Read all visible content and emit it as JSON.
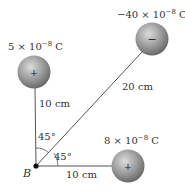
{
  "charges": [
    {
      "id": "q1",
      "label_base": "5 × 10",
      "label_exp": "−8",
      "label_unit": " C",
      "sign": "+",
      "cx": 34,
      "cy": 72
    },
    {
      "id": "q2",
      "label_base": "−40 × 10",
      "label_exp": "−8",
      "label_unit": " C",
      "sign": "−",
      "cx": 152,
      "cy": 39
    },
    {
      "id": "q3",
      "label_base": "8 × 10",
      "label_exp": "−8",
      "label_unit": " C",
      "sign": "+",
      "cx": 128,
      "cy": 166
    }
  ],
  "point": {
    "label": "B",
    "x": 36,
    "y": 166
  },
  "distances": {
    "vertical": "10 cm",
    "diagonal": "20 cm",
    "horizontal": "10 cm"
  },
  "angles": {
    "upper": "45°",
    "lower": "45°"
  },
  "colors": {
    "sphere_light": "#d8d8d8",
    "sphere_dark": "#6e6e6e",
    "line": "#555555",
    "text": "#333333"
  }
}
